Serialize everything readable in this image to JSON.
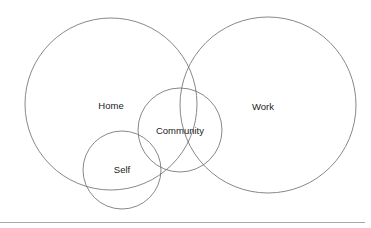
{
  "diagram": {
    "type": "venn",
    "circles": [
      {
        "id": "home",
        "label": "Home",
        "cx": 111,
        "cy": 104,
        "r": 86,
        "label_x": 111,
        "label_y": 105
      },
      {
        "id": "work",
        "label": "Work",
        "cx": 268,
        "cy": 105,
        "r": 88,
        "label_x": 263,
        "label_y": 106
      },
      {
        "id": "community",
        "label": "Community",
        "cx": 180,
        "cy": 130,
        "r": 42,
        "label_x": 180,
        "label_y": 130
      },
      {
        "id": "self",
        "label": "Self",
        "cx": 122,
        "cy": 170,
        "r": 39,
        "label_x": 122,
        "label_y": 169
      }
    ],
    "stroke_color": "#6a6a6a",
    "text_color": "#222222",
    "rule_color": "#a8a8a8"
  }
}
